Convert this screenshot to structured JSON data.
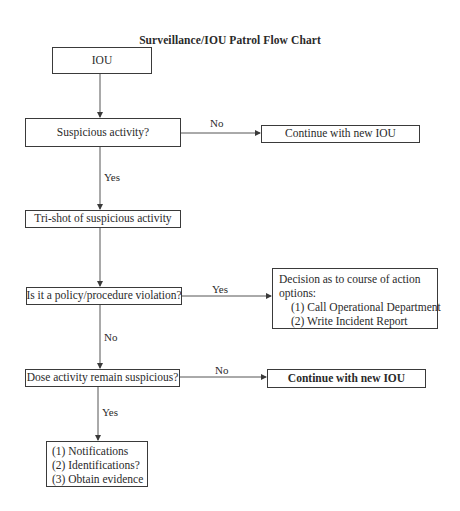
{
  "title": "Surveillance/IOU Patrol Flow Chart",
  "nodes": {
    "iou": {
      "label": "IOU"
    },
    "suspicious": {
      "label": "Suspicious activity?"
    },
    "continue_1": {
      "label": "Continue with new IOU"
    },
    "trishot": {
      "label": "Tri-shot of suspicious activity"
    },
    "policy": {
      "label": "Is it a policy/procedure violation?"
    },
    "decision": {
      "heading_line1": "Decision as to course of action",
      "heading_line2": "options:",
      "items": [
        "(1) Call Operational Department",
        "(2) Write Incident Report"
      ]
    },
    "remain": {
      "label": "Dose activity remain suspicious?"
    },
    "continue_2": {
      "label": "Continue with new IOU"
    },
    "final": {
      "items": [
        "(1) Notifications",
        "(2) Identifications?",
        "(3) Obtain evidence"
      ]
    }
  },
  "edges": {
    "suspicious_no": "No",
    "suspicious_yes": "Yes",
    "policy_yes": "Yes",
    "policy_no": "No",
    "remain_no": "No",
    "remain_yes": "Yes"
  },
  "colors": {
    "stroke": "#3a3a3a",
    "text": "#2a2a2a",
    "background": "#ffffff"
  }
}
